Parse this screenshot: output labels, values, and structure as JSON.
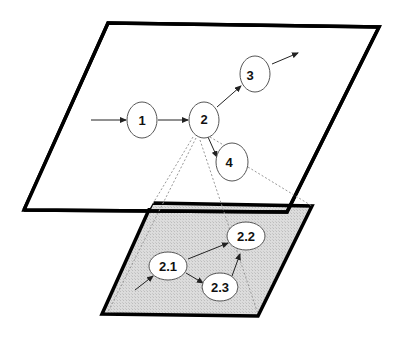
{
  "diagram": {
    "type": "hierarchical-process-decomposition",
    "colors": {
      "plane_outline": "#000000",
      "lower_plane_fill": "#d9d9d9",
      "node_stroke": "#555555",
      "node_fill": "#ffffff",
      "dotted_projection": "#999999",
      "arrow": "#222222"
    },
    "upper_plane": {
      "nodes": [
        {
          "id": "n1",
          "label": "1"
        },
        {
          "id": "n2",
          "label": "2"
        },
        {
          "id": "n3",
          "label": "3"
        },
        {
          "id": "n4",
          "label": "4"
        }
      ],
      "edges": [
        {
          "from": "in",
          "to": "n1"
        },
        {
          "from": "n1",
          "to": "n2"
        },
        {
          "from": "n2",
          "to": "n3"
        },
        {
          "from": "n2",
          "to": "n4"
        },
        {
          "from": "n3",
          "to": "out"
        }
      ]
    },
    "lower_plane": {
      "expands": "n2",
      "nodes": [
        {
          "id": "n21",
          "label": "2.1"
        },
        {
          "id": "n22",
          "label": "2.2"
        },
        {
          "id": "n23",
          "label": "2.3"
        }
      ],
      "edges": [
        {
          "from": "in",
          "to": "n21"
        },
        {
          "from": "n21",
          "to": "n22"
        },
        {
          "from": "n21",
          "to": "n23"
        },
        {
          "from": "n23",
          "to": "n22"
        }
      ]
    }
  }
}
